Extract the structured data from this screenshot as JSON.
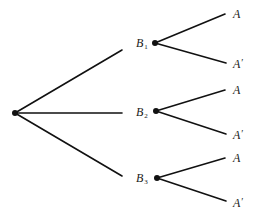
{
  "diagram": {
    "type": "probability-tree",
    "root": {
      "x": 15,
      "y": 113
    },
    "first_level": [
      {
        "label_letter": "B",
        "label_sub": "1",
        "edge_end": {
          "x": 122,
          "y": 50
        },
        "node": {
          "x": 155,
          "y": 43
        },
        "label_pos": {
          "x": 136,
          "y": 37
        },
        "children": [
          {
            "label": "A",
            "prime": "",
            "end": {
              "x": 225,
              "y": 14
            },
            "label_pos": {
              "x": 233,
              "y": 8
            }
          },
          {
            "label": "A",
            "prime": "′",
            "end": {
              "x": 226,
              "y": 63
            },
            "label_pos": {
              "x": 233,
              "y": 58
            }
          }
        ]
      },
      {
        "label_letter": "B",
        "label_sub": "2",
        "edge_end": {
          "x": 122,
          "y": 113
        },
        "node": {
          "x": 156,
          "y": 111
        },
        "label_pos": {
          "x": 136,
          "y": 106
        },
        "children": [
          {
            "label": "A",
            "prime": "",
            "end": {
              "x": 225,
              "y": 90
            },
            "label_pos": {
              "x": 233,
              "y": 84
            }
          },
          {
            "label": "A",
            "prime": "′",
            "end": {
              "x": 226,
              "y": 134
            },
            "label_pos": {
              "x": 233,
              "y": 129
            }
          }
        ]
      },
      {
        "label_letter": "B",
        "label_sub": "3",
        "edge_end": {
          "x": 122,
          "y": 176
        },
        "node": {
          "x": 157,
          "y": 178
        },
        "label_pos": {
          "x": 136,
          "y": 172
        },
        "children": [
          {
            "label": "A",
            "prime": "",
            "end": {
              "x": 225,
              "y": 158
            },
            "label_pos": {
              "x": 233,
              "y": 152
            }
          },
          {
            "label": "A",
            "prime": "′",
            "end": {
              "x": 226,
              "y": 201
            },
            "label_pos": {
              "x": 233,
              "y": 197
            }
          }
        ]
      }
    ],
    "colors": {
      "line": "#111111",
      "text": "#1a1a1a",
      "background": "#ffffff"
    }
  }
}
